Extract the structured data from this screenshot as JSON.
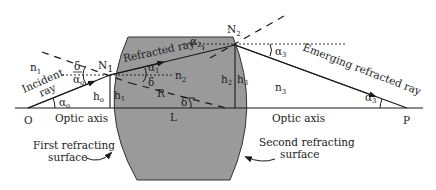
{
  "diagram": {
    "type": "thick lens ray refraction diagram",
    "colors": {
      "lens_fill": "#9a9a9a",
      "line": "#1a1a1a",
      "background": "#ffffff"
    },
    "points": {
      "O": "O",
      "P": "P",
      "N1": "N",
      "N1_sub": "1",
      "N2": "N",
      "N2_sub": "2"
    },
    "media": {
      "n1": "n",
      "n1_sub": "1",
      "n2": "n",
      "n2_sub": "2",
      "n3": "n",
      "n3_sub": "3"
    },
    "heights": {
      "h0": "h",
      "h0_sub": "o",
      "h1": "h",
      "h1_sub": "1",
      "h2": "h",
      "h2_sub": "2",
      "h3": "h",
      "h3_sub": "3"
    },
    "angles": {
      "alpha0_axis": "α",
      "alpha0_axis_sub": "o",
      "alpha0_top": "α",
      "alpha0_top_sub": "o",
      "alpha1": "α",
      "alpha1_sub": "1",
      "alpha2": "α",
      "alpha2_sub": "2",
      "alpha3_top": "α",
      "alpha3_top_sub": "3",
      "alpha3_axis": "α",
      "alpha3_axis_sub": "3",
      "delta_left": "δ",
      "delta_inner": "δ",
      "delta_axis": "δ"
    },
    "labels": {
      "incident_ray": "Incident",
      "incident_ray_2": "ray",
      "refracted_ray": "Refracted ray",
      "emerging_ray": "Emerging refracted ray",
      "radius": "R",
      "thickness": "L",
      "optic_axis_left": "Optic axis",
      "optic_axis_right": "Optic axis",
      "first_surface_1": "First refracting",
      "first_surface_2": "surface",
      "second_surface_1": "Second refracting",
      "second_surface_2": "surface"
    }
  }
}
